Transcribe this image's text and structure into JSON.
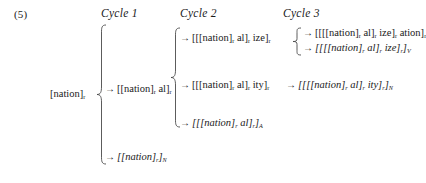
{
  "example": {
    "number": "(5)"
  },
  "headers": {
    "cycle1": "Cycle 1",
    "cycle2": "Cycle 2",
    "cycle3": "Cycle 3"
  },
  "base": {
    "text": "[nation]",
    "subscript": "r"
  },
  "arrow_glyph": "→",
  "derivations": {
    "cycle1": [
      {
        "id": "c1-nation-al",
        "arrow": "→",
        "italic": false,
        "parts": [
          {
            "t": "[[nation]",
            "sub": "r"
          },
          {
            "t": " al]",
            "sub": "r"
          }
        ],
        "plain": "→ [[nation]r al]r"
      },
      {
        "id": "c1-nation-N",
        "arrow": "→",
        "italic": true,
        "parts": [
          {
            "t": "[[nation]",
            "sub": "r"
          },
          {
            "t": "]",
            "sub": "N"
          }
        ],
        "plain": "→ [[nation]r]N"
      }
    ],
    "cycle2": [
      {
        "id": "c2-nation-al-ize",
        "arrow": "→",
        "italic": false,
        "parts": [
          {
            "t": "[[[nation]",
            "sub": "r"
          },
          {
            "t": " al]",
            "sub": "r"
          },
          {
            "t": " ize]",
            "sub": "r"
          }
        ],
        "plain": "→ [[[nation]r al]r ize]r"
      },
      {
        "id": "c2-nation-al-ity",
        "arrow": "→",
        "italic": false,
        "parts": [
          {
            "t": "[[[nation]",
            "sub": "r"
          },
          {
            "t": " al]",
            "sub": "r"
          },
          {
            "t": " ity]",
            "sub": "r"
          }
        ],
        "plain": "→ [[[nation]r al]r ity]r"
      },
      {
        "id": "c2-nation-al-A",
        "arrow": "→",
        "italic": true,
        "parts": [
          {
            "t": "[[[nation]",
            "sub": "r"
          },
          {
            "t": " al]",
            "sub": "r"
          },
          {
            "t": "]",
            "sub": "A"
          }
        ],
        "plain": "→ [[[nation]r al]r]A"
      }
    ],
    "cycle3": [
      {
        "id": "c3-nation-al-ize-ation",
        "arrow": "→",
        "italic": false,
        "parts": [
          {
            "t": "[[[[nation]",
            "sub": "r"
          },
          {
            "t": " al]",
            "sub": "r"
          },
          {
            "t": " ize]",
            "sub": "r"
          },
          {
            "t": " ation]",
            "sub": "r"
          }
        ],
        "plain": "→ [[[[nation]r al]r ize]r ation]r"
      },
      {
        "id": "c3-nation-al-ize-V",
        "arrow": "→",
        "italic": true,
        "parts": [
          {
            "t": "[[[[nation]",
            "sub": "r"
          },
          {
            "t": " al]",
            "sub": "r"
          },
          {
            "t": " ize]",
            "sub": "r"
          },
          {
            "t": "]",
            "sub": "V"
          }
        ],
        "plain": "→ [[[[nation]r al]r ize]r]V"
      },
      {
        "id": "c3-nation-al-ity-N",
        "arrow": "→",
        "italic": true,
        "parts": [
          {
            "t": "[[[[nation]",
            "sub": "r"
          },
          {
            "t": " al]",
            "sub": "r"
          },
          {
            "t": " ity]",
            "sub": "r"
          },
          {
            "t": "]",
            "sub": "N"
          }
        ],
        "plain": "→ [[[[nation]r al]r ity]r]N"
      }
    ]
  },
  "colors": {
    "text": "#1a1a1a",
    "background": "#ffffff",
    "brace": "#4a4a4a"
  }
}
